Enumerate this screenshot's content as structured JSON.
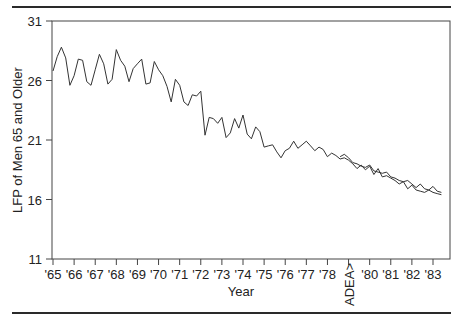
{
  "chart_data": {
    "type": "line",
    "title": "",
    "xlabel": "Year",
    "ylabel": "LFP of Men 65 and Older",
    "ylim": [
      11,
      31
    ],
    "yticks": [
      11,
      16,
      21,
      26,
      31
    ],
    "xtick_labels": [
      "'65",
      "'66",
      "'67",
      "'68",
      "'69",
      "'70",
      "'71",
      "'72",
      "'73",
      "'74",
      "'75",
      "'76",
      "'77",
      "'78",
      "ADEA>",
      "'80",
      "'81",
      "'82",
      "'83"
    ],
    "grid": false,
    "legend": null,
    "annotations": [
      "ADEA>"
    ],
    "series": [
      {
        "name": "Actual",
        "x": [
          1965.0,
          1965.2,
          1965.4,
          1965.6,
          1965.8,
          1966.0,
          1966.2,
          1966.4,
          1966.6,
          1966.8,
          1967.0,
          1967.2,
          1967.4,
          1967.6,
          1967.8,
          1968.0,
          1968.2,
          1968.4,
          1968.6,
          1968.8,
          1969.0,
          1969.2,
          1969.4,
          1969.6,
          1969.8,
          1970.0,
          1970.2,
          1970.4,
          1970.6,
          1970.8,
          1971.0,
          1971.2,
          1971.4,
          1971.6,
          1971.8,
          1972.0,
          1972.2,
          1972.4,
          1972.6,
          1972.8,
          1973.0,
          1973.2,
          1973.4,
          1973.6,
          1973.8,
          1974.0,
          1974.2,
          1974.4,
          1974.6,
          1974.8,
          1975.0,
          1975.2,
          1975.4,
          1975.6,
          1975.8,
          1976.0,
          1976.2,
          1976.4,
          1976.6,
          1976.8,
          1977.0,
          1977.2,
          1977.4,
          1977.6,
          1977.8,
          1978.0,
          1978.2,
          1978.4,
          1978.6,
          1978.8,
          1979.0,
          1979.2,
          1979.4,
          1979.6,
          1979.8,
          1980.0,
          1980.2,
          1980.4,
          1980.6,
          1980.8,
          1981.0,
          1981.2,
          1981.4,
          1981.6,
          1981.8,
          1982.0,
          1982.2,
          1982.4,
          1982.6,
          1982.8,
          1983.0,
          1983.2,
          1983.4
        ],
        "values": [
          26.8,
          28.0,
          28.8,
          27.9,
          25.6,
          26.4,
          27.8,
          27.7,
          25.9,
          25.6,
          26.9,
          28.2,
          27.4,
          25.7,
          26.1,
          28.6,
          27.7,
          27.2,
          25.9,
          27.0,
          27.4,
          27.8,
          25.7,
          25.8,
          27.6,
          26.9,
          26.4,
          25.5,
          24.2,
          26.1,
          25.6,
          24.2,
          23.9,
          24.8,
          24.7,
          25.1,
          21.4,
          22.9,
          22.8,
          22.4,
          22.9,
          21.2,
          21.6,
          22.8,
          22.0,
          23.1,
          21.5,
          21.1,
          22.1,
          21.7,
          20.4,
          20.5,
          20.6,
          20.0,
          19.5,
          20.1,
          20.3,
          20.9,
          20.3,
          20.6,
          20.9,
          20.5,
          20.1,
          20.4,
          20.2,
          19.6,
          19.9,
          19.7,
          19.4,
          19.5,
          19.3,
          19.0,
          18.6,
          18.9,
          18.5,
          18.8,
          18.1,
          18.6,
          17.9,
          18.0,
          17.8,
          17.6,
          17.3,
          17.5,
          16.9,
          17.2,
          16.8,
          16.7,
          16.6,
          16.8,
          16.6,
          16.5,
          16.4
        ]
      },
      {
        "name": "Predicted",
        "x_start": 1978.6,
        "values_note": "Second line overlapping actual series from ADEA onward",
        "x": [
          1978.6,
          1978.8,
          1979.0,
          1979.2,
          1979.4,
          1979.6,
          1979.8,
          1980.0,
          1980.2,
          1980.4,
          1980.6,
          1980.8,
          1981.0,
          1981.2,
          1981.4,
          1981.6,
          1981.8,
          1982.0,
          1982.2,
          1982.4,
          1982.6,
          1982.8,
          1983.0,
          1983.2,
          1983.4
        ],
        "values": [
          19.6,
          19.8,
          19.5,
          19.1,
          19.0,
          18.8,
          18.7,
          18.9,
          18.4,
          18.3,
          18.2,
          18.3,
          17.9,
          17.8,
          17.6,
          17.5,
          17.6,
          17.3,
          17.0,
          17.3,
          16.9,
          16.8,
          17.1,
          16.7,
          16.6
        ]
      }
    ]
  },
  "axis": {
    "y_title": "LFP of Men 65 and Older",
    "x_title": "Year",
    "y_ticks": [
      "31",
      "26",
      "21",
      "16",
      "11"
    ],
    "x_ticks": [
      "'65",
      "'66",
      "'67",
      "'68",
      "'69",
      "'70",
      "'71",
      "'72",
      "'73",
      "'74",
      "'75",
      "'76",
      "'77",
      "'78",
      "ADEA>",
      "'80",
      "'81",
      "'82",
      "'83"
    ]
  }
}
